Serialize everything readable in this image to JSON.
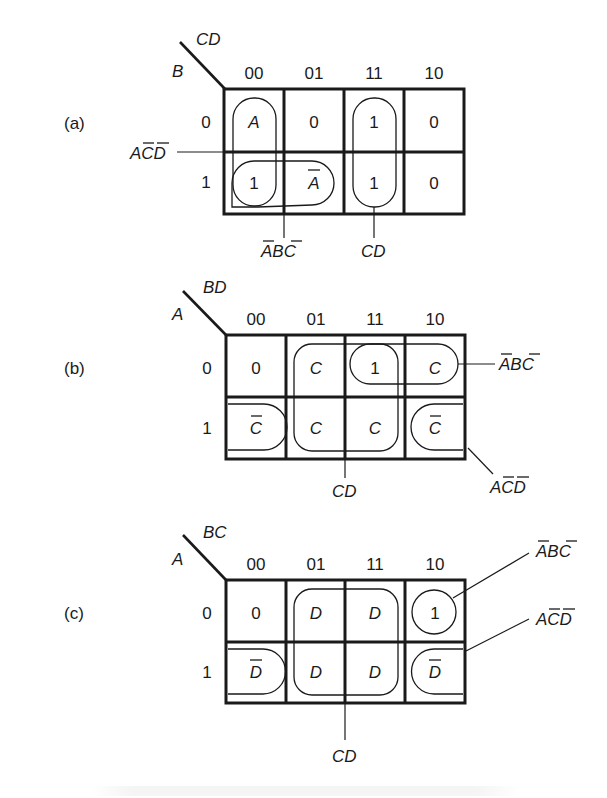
{
  "figure": {
    "maps": [
      {
        "id": "a",
        "panel_label": "(a)",
        "row_var": "B",
        "col_var": "CD",
        "col_labels": [
          "00",
          "01",
          "11",
          "10"
        ],
        "row_labels": [
          "0",
          "1"
        ],
        "cells": [
          [
            "A",
            "0",
            "1",
            "0"
          ],
          [
            "1",
            "A",
            "1",
            "0"
          ]
        ],
        "cell_overbar": [
          [
            false,
            false,
            false,
            false
          ],
          [
            false,
            true,
            false,
            false
          ]
        ],
        "groups": [
          {
            "name": "ACD",
            "overbars": [
              1,
              2
            ],
            "cells": "column 00 (rows 0-1)"
          },
          {
            "name": "ABC",
            "overbars": [
              0,
              2
            ],
            "cells": "row 1, columns 00-01"
          },
          {
            "name": "CD",
            "overbars": [],
            "cells": "column 11 (rows 0-1)"
          }
        ]
      },
      {
        "id": "b",
        "panel_label": "(b)",
        "row_var": "A",
        "col_var": "BD",
        "col_labels": [
          "00",
          "01",
          "11",
          "10"
        ],
        "row_labels": [
          "0",
          "1"
        ],
        "cells": [
          [
            "0",
            "C",
            "1",
            "C"
          ],
          [
            "C",
            "C",
            "C",
            "C"
          ]
        ],
        "cell_overbar": [
          [
            false,
            false,
            false,
            false
          ],
          [
            true,
            false,
            false,
            true
          ]
        ],
        "groups": [
          {
            "name": "ABC",
            "overbars": [
              0,
              2
            ],
            "cells": "row 0, columns 11-10"
          },
          {
            "name": "CD",
            "overbars": [],
            "cells": "columns 01-11, rows 0-1"
          },
          {
            "name": "ACD",
            "overbars": [
              1,
              2
            ],
            "cells": "row 1, columns 00 and 10 (wrap)"
          }
        ]
      },
      {
        "id": "c",
        "panel_label": "(c)",
        "row_var": "A",
        "col_var": "BC",
        "col_labels": [
          "00",
          "01",
          "11",
          "10"
        ],
        "row_labels": [
          "0",
          "1"
        ],
        "cells": [
          [
            "0",
            "D",
            "D",
            "1"
          ],
          [
            "D",
            "D",
            "D",
            "D"
          ]
        ],
        "cell_overbar": [
          [
            false,
            false,
            false,
            false
          ],
          [
            true,
            false,
            false,
            true
          ]
        ],
        "groups": [
          {
            "name": "ABC",
            "overbars": [
              0,
              2
            ],
            "cells": "row 0, column 10"
          },
          {
            "name": "ACD",
            "overbars": [
              1,
              2
            ],
            "cells": "row 1, columns 00 and 10 (wrap)"
          },
          {
            "name": "CD",
            "overbars": [],
            "cells": "columns 01-11, rows 0-1"
          }
        ]
      }
    ]
  }
}
